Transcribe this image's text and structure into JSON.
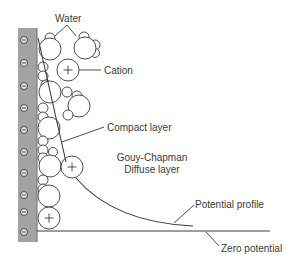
{
  "diagram": {
    "labels": {
      "water": "Water",
      "cation": "Cation",
      "compact_layer": "Compact layer",
      "gouy_chapman_line1": "Gouy-Chapman",
      "gouy_chapman_line2": "Diffuse layer",
      "potential_profile": "Potential profile",
      "zero_potential": "Zero potential"
    },
    "electrode": {
      "fill": "#a3a3a3",
      "charge_symbol": "⊖",
      "negative_charges": 10
    },
    "cation_symbol": "+",
    "colors": {
      "stroke": "#3a3a3a",
      "text": "#3a3a3a",
      "electrode": "#a3a3a3"
    }
  }
}
